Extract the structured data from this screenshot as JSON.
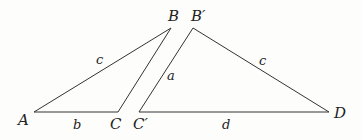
{
  "diagram": {
    "type": "geometry",
    "line_color": "#333333",
    "triangles": [
      {
        "name": "ABC",
        "vertices": {
          "A": {
            "label": "A",
            "x": 34,
            "y": 112
          },
          "B": {
            "label": "B",
            "x": 171,
            "y": 28
          },
          "C": {
            "label": "C",
            "x": 118,
            "y": 112
          }
        },
        "sides": {
          "AB": {
            "label": "c"
          },
          "AC": {
            "label": "b"
          }
        }
      },
      {
        "name": "C'B'D",
        "vertices": {
          "C_prime": {
            "label": "C′",
            "x": 139,
            "y": 112
          },
          "B_prime": {
            "label": "B′",
            "x": 193,
            "y": 28
          },
          "D": {
            "label": "D",
            "x": 329,
            "y": 112
          }
        },
        "sides": {
          "C_primeB_prime": {
            "label": "a"
          },
          "B_primeD": {
            "label": "c"
          },
          "C_primeD": {
            "label": "d"
          }
        }
      }
    ]
  }
}
